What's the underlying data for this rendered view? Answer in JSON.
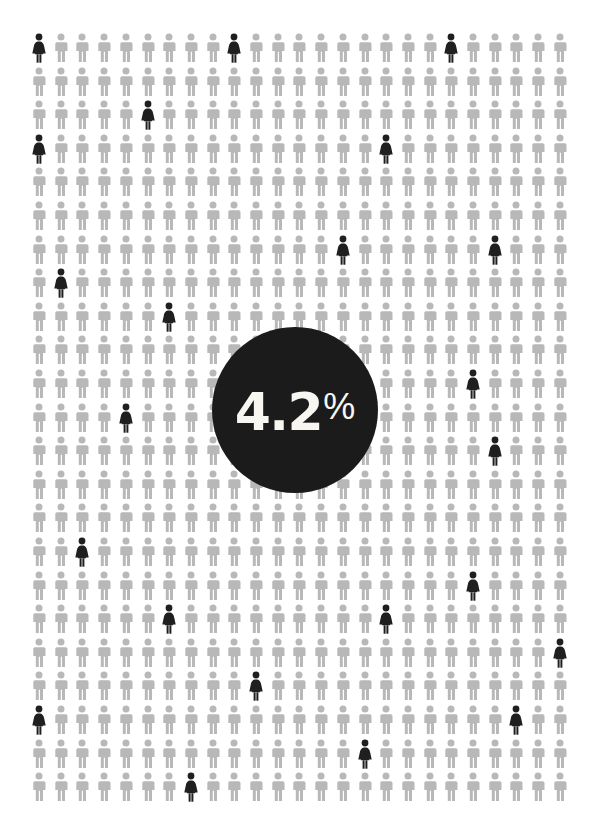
{
  "infographic": {
    "type": "pictogram-isotype",
    "title": "4.2% pictogram infographic",
    "background_color": "#ffffff"
  },
  "stat": {
    "number": "4.2",
    "unit": "%",
    "full_label": "4.2%",
    "circle_color": "#1b1b1b",
    "text_color": "#f7f6f1"
  },
  "legend": {
    "base_figure_name": "person-male-icon",
    "highlight_figure_name": "person-female-icon",
    "base_color": "#b8b8b8",
    "highlight_color": "#1f1f1f"
  },
  "chart_data": {
    "type": "pictogram",
    "title": "4.2%",
    "xlabel": "",
    "ylabel": "",
    "unit": "%",
    "highlight_value": 4.2,
    "remainder_value": 95.8,
    "grid": {
      "columns": 25,
      "rows": 23,
      "total_figures": 575,
      "origin_x": 30,
      "origin_y": 33,
      "pitch_x": 21.7,
      "pitch_y": 33.6
    },
    "series": [
      {
        "name": "Highlighted",
        "glyph": "female",
        "color": "#1f1f1f",
        "count": 24
      },
      {
        "name": "Background",
        "glyph": "male",
        "color": "#b8b8b8",
        "count": 551
      }
    ],
    "highlighted_cells": [
      [
        0,
        0
      ],
      [
        0,
        9
      ],
      [
        0,
        19
      ],
      [
        2,
        5
      ],
      [
        3,
        0
      ],
      [
        3,
        16
      ],
      [
        6,
        14
      ],
      [
        6,
        21
      ],
      [
        7,
        1
      ],
      [
        8,
        6
      ],
      [
        10,
        20
      ],
      [
        11,
        4
      ],
      [
        12,
        21
      ],
      [
        15,
        2
      ],
      [
        16,
        20
      ],
      [
        17,
        6
      ],
      [
        17,
        16
      ],
      [
        18,
        24
      ],
      [
        19,
        10
      ],
      [
        20,
        0
      ],
      [
        20,
        22
      ],
      [
        21,
        15
      ],
      [
        22,
        7
      ]
    ]
  }
}
